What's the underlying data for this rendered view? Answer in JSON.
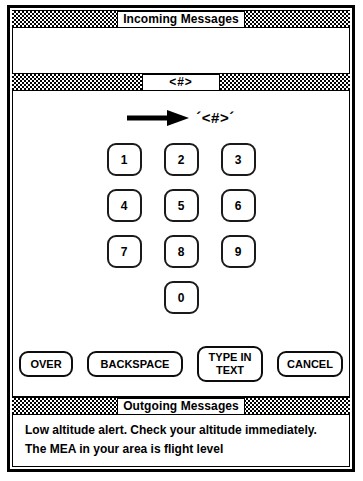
{
  "panels": {
    "incoming": {
      "title": "Incoming Messages",
      "body_text": ""
    },
    "entry": {
      "title": "<#>",
      "arrow_icon": "right-arrow-icon",
      "value": "´<#>´"
    },
    "outgoing": {
      "title": "Outgoing Messages",
      "body_text": "Low altitude alert. Check your altitude immediately.\nThe MEA in your area is flight level"
    }
  },
  "keypad": {
    "rows": [
      [
        "1",
        "2",
        "3"
      ],
      [
        "4",
        "5",
        "6"
      ],
      [
        "7",
        "8",
        "9"
      ]
    ],
    "zero": "0"
  },
  "actions": [
    {
      "label": "OVER",
      "width": 54,
      "tall": false
    },
    {
      "label": "BACKSPACE",
      "width": 96,
      "tall": false
    },
    {
      "label": "TYPE IN\nTEXT",
      "width": 66,
      "tall": true
    },
    {
      "label": "CANCEL",
      "width": 66,
      "tall": false
    }
  ],
  "colors": {
    "ink": "#000000",
    "paper": "#ffffff",
    "button_border": "#0d0d0d"
  }
}
